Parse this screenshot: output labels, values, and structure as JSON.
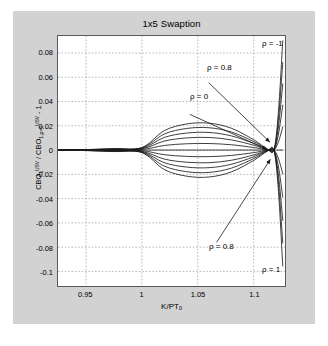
{
  "figure": {
    "title": "1x5 Swaption",
    "background_color": "#d2d2d2",
    "plot_background_color": "#ffffff",
    "frame_color": "#5a5a5a",
    "grid_color": "#9a9a9a",
    "curve_color": "#1a1a1a"
  },
  "axis": {
    "xlabel_html": "K/PT<sub>0</sub>",
    "ylabel_html": "CBO<sub>1</sub><sup>USV</sup> / CBO<sub>1,&rho;=0</sub><sup>USV</sup> - 1",
    "xticks": [
      "0.95",
      "1",
      "1.05",
      "1.1"
    ],
    "yticks": [
      "0.08",
      "0.06",
      "0.04",
      "0.02",
      "0",
      "-0.02",
      "-0.04",
      "-0.06",
      "-0.08",
      "-0.1"
    ]
  },
  "annotations": [
    {
      "name": "rho-minus-1",
      "text": "ρ = -1",
      "x": 205,
      "y": 4
    },
    {
      "name": "rho-0p8-upper",
      "text": "ρ = 0.8",
      "x": 150,
      "y": 28
    },
    {
      "name": "rho-0-middle",
      "text": "ρ = 0",
      "x": 133,
      "y": 57
    },
    {
      "name": "rho-0p8-lower",
      "text": "ρ = 0.8",
      "x": 152,
      "y": 207
    },
    {
      "name": "rho-1",
      "text": "ρ = 1",
      "x": 205,
      "y": 230
    }
  ],
  "chart_data": {
    "type": "line",
    "title": "1x5 Swaption",
    "xlabel": "K/PT_0",
    "ylabel": "CBO_1^USV / CBO_{1,rho=0}^USV - 1",
    "xlim": [
      0.925,
      1.128
    ],
    "ylim": [
      -0.112,
      0.094
    ],
    "grid": true,
    "legend": "annotations",
    "xticks": [
      0.95,
      1.0,
      1.05,
      1.1
    ],
    "yticks": [
      0.08,
      0.06,
      0.04,
      0.02,
      0,
      -0.02,
      -0.04,
      -0.06,
      -0.08,
      -0.1
    ],
    "x": [
      0.925,
      0.95,
      0.975,
      1.0,
      1.02,
      1.04,
      1.06,
      1.08,
      1.1,
      1.112,
      1.118,
      1.122,
      1.126
    ],
    "series": [
      {
        "name": "rho = -1",
        "rho": -1.0,
        "values": [
          0.0,
          0.0004,
          0.0012,
          0.0021,
          0.016,
          0.0215,
          0.0222,
          0.018,
          0.0085,
          0.001,
          0.0,
          0.03,
          0.09
        ]
      },
      {
        "name": "rho = -0.8",
        "rho": -0.8,
        "values": [
          0.0,
          0.0003,
          0.001,
          0.0018,
          0.0132,
          0.0178,
          0.0184,
          0.0149,
          0.007,
          0.0008,
          0.0,
          0.024,
          0.072
        ]
      },
      {
        "name": "rho = -0.6",
        "rho": -0.6,
        "values": [
          0.0,
          0.0003,
          0.0008,
          0.0014,
          0.0104,
          0.014,
          0.0145,
          0.0117,
          0.0055,
          0.0006,
          0.0,
          0.0182,
          0.0545
        ]
      },
      {
        "name": "rho = -0.4",
        "rho": -0.4,
        "values": [
          0.0,
          0.0002,
          0.0005,
          0.001,
          0.0074,
          0.01,
          0.0104,
          0.0084,
          0.004,
          0.0004,
          0.0,
          0.0124,
          0.037
        ]
      },
      {
        "name": "rho = -0.2",
        "rho": -0.2,
        "values": [
          0.0,
          0.0001,
          0.0003,
          0.0005,
          0.0038,
          0.0052,
          0.0054,
          0.0044,
          0.0021,
          0.0002,
          0.0,
          0.0064,
          0.019
        ]
      },
      {
        "name": "rho = 0",
        "rho": 0.0,
        "values": [
          0.0,
          0.0,
          0.0,
          0.0,
          0.0,
          0.0,
          0.0,
          0.0,
          0.0,
          0.0,
          0.0,
          0.0,
          0.0
        ]
      },
      {
        "name": "rho = 0.2",
        "rho": 0.2,
        "values": [
          0.0,
          -0.0001,
          -0.0003,
          -0.0005,
          -0.0038,
          -0.0052,
          -0.0054,
          -0.0044,
          -0.0021,
          -0.0002,
          0.0,
          -0.0066,
          -0.0196
        ]
      },
      {
        "name": "rho = 0.4",
        "rho": 0.4,
        "values": [
          0.0,
          -0.0002,
          -0.0005,
          -0.001,
          -0.0074,
          -0.01,
          -0.0104,
          -0.0084,
          -0.004,
          -0.0004,
          0.0,
          -0.013,
          -0.0388
        ]
      },
      {
        "name": "rho = 0.6",
        "rho": 0.6,
        "values": [
          0.0,
          -0.0003,
          -0.0008,
          -0.0014,
          -0.0104,
          -0.014,
          -0.0145,
          -0.0117,
          -0.0055,
          -0.0006,
          0.0,
          -0.0193,
          -0.0578
        ]
      },
      {
        "name": "rho = 0.8",
        "rho": 0.8,
        "values": [
          0.0,
          -0.0003,
          -0.001,
          -0.0018,
          -0.0132,
          -0.0178,
          -0.0184,
          -0.0149,
          -0.007,
          -0.0008,
          0.0,
          -0.0256,
          -0.0765
        ]
      },
      {
        "name": "rho = 1",
        "rho": 1.0,
        "values": [
          0.0,
          -0.0004,
          -0.0012,
          -0.0021,
          -0.016,
          -0.0215,
          -0.0222,
          -0.018,
          -0.0085,
          -0.001,
          0.0,
          -0.032,
          -0.0955
        ]
      }
    ],
    "arrows": [
      {
        "from_label": "rho = 0.8 (upper)",
        "to_x": 1.1145,
        "to_y": 0.0065
      },
      {
        "from_label": "rho = 0 (middle)",
        "to_x": 1.112,
        "to_y": 0.0005
      },
      {
        "from_label": "rho = 0.8 (lower)",
        "to_x": 1.115,
        "to_y": -0.0075
      }
    ]
  }
}
